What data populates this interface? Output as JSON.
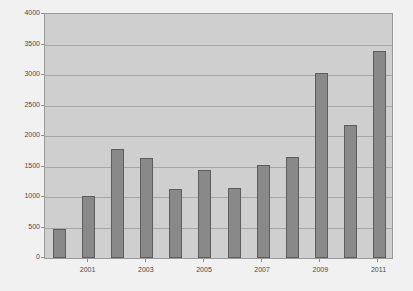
{
  "chart_data": {
    "type": "bar",
    "title": "",
    "subtitle": "",
    "xlabel": "",
    "ylabel": "",
    "categories": [
      "2000",
      "2001",
      "2002",
      "2003",
      "2004",
      "2005",
      "2006",
      "2007",
      "2008",
      "2009",
      "2010",
      "2011"
    ],
    "values": [
      470,
      1010,
      1780,
      1640,
      1140,
      1440,
      1150,
      1520,
      1660,
      3040,
      2180,
      3390
    ],
    "series": [
      {
        "name": "",
        "values": [
          470,
          1010,
          1780,
          1640,
          1140,
          1440,
          1150,
          1520,
          1660,
          3040,
          2180,
          3390
        ]
      }
    ],
    "ylim": [
      0,
      4000
    ],
    "y_ticks": [
      0,
      500,
      1000,
      1500,
      2000,
      2500,
      3000,
      3500,
      4000
    ],
    "y_tick_labels": [
      "0",
      "500",
      "1000",
      "1500",
      "2000",
      "2500",
      "3000",
      "3500",
      "4000"
    ],
    "x_tick_labels": [
      "2001",
      "2003",
      "2005",
      "2007",
      "2009",
      "2011"
    ],
    "x_tick_label_categories": [
      "2001",
      "2003",
      "2005",
      "2007",
      "2009",
      "2011"
    ],
    "grid": true,
    "grid_axis": "y",
    "legend": false,
    "legend_position": "none",
    "annotations": [],
    "colors": {
      "bar_fill": "#898989",
      "bar_border": "#5d5d5d",
      "plot_background": "#cfcfcf",
      "page_background": "#f1f1f1",
      "gridline": "#a6a6a6",
      "axis_border": "#9a9a9a",
      "tick_text": "#4a4a4a"
    }
  }
}
